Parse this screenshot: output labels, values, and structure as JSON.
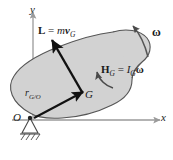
{
  "figure": {
    "name": "rigid-body-angular-momentum-diagram",
    "background_color": "#ffffff",
    "body_fill_color": "#d2d2d2",
    "body_stroke_color": "#555555",
    "vector_color": "#111111",
    "axis_color": "#9a9a9a"
  },
  "axes": {
    "y_label": "y",
    "x_label": "x",
    "origin_label": "O"
  },
  "points": {
    "center_of_mass_label": "G"
  },
  "vectors": {
    "position": {
      "symbol": "r",
      "subscript": "G/O",
      "full_label": "r G/O"
    },
    "linear_momentum": {
      "symbol": "L",
      "equals": "=",
      "expression_mass": "m",
      "expression_velocity": "v",
      "expression_subscript": "G",
      "full_label": "L = mv G"
    },
    "angular_momentum": {
      "symbol": "H",
      "symbol_subscript": "G",
      "equals": "=",
      "inertia": "I",
      "inertia_subscript": "G",
      "omega": "ω",
      "full_label": "H G = I G ω"
    },
    "angular_velocity": {
      "symbol": "ω",
      "full_label": "ω"
    }
  },
  "support": {
    "type": "pin-support",
    "label": "pin support with ground hatching"
  }
}
